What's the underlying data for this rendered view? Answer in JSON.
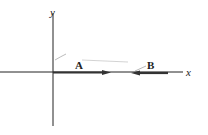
{
  "diagram": {
    "axes": {
      "x_label": "x",
      "y_label": "y"
    },
    "vectors": [
      {
        "label": "A",
        "direction": "+x",
        "from": "origin"
      },
      {
        "label": "B",
        "direction": "-x"
      }
    ],
    "colors": {
      "axis": "#222222",
      "vector": "#333333",
      "faint": "#b0b0b0"
    }
  }
}
